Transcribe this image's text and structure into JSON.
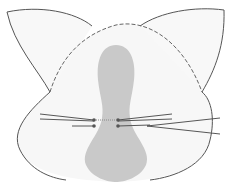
{
  "diagram": {
    "title": "",
    "width": 232,
    "height": 188,
    "colors": {
      "background": "#ffffff",
      "face_fill": "#f7f7f7",
      "outline": "#555555",
      "dashed": "#666666",
      "muzzle_fill": "#c9c9c9",
      "whisker": "#444444",
      "whisker_dot": "#555555"
    },
    "parts": {
      "left_ear": "M 50 92 C 38 70, 14 45, 7 12 C 40 5, 75 12, 92 26",
      "right_ear": "M 140 26 C 160 12, 195 6, 224 10 C 225 45, 215 70, 202 92",
      "face_outline": "M 50 92 C 30 110, 10 130, 20 150 C 30 170, 50 178, 66 180 M 150 180 C 175 177, 205 165, 210 140 C 215 120, 212 100, 202 92",
      "head_dashed": "M 50 92 C 60 60, 80 35, 116 25 C 150 18, 185 45, 202 92",
      "muzzle": "M 116 45 C 102 45, 96 60, 98 80 C 100 98, 104 105, 102 118 C 100 135, 80 150, 86 165 C 92 178, 108 182, 116 182 C 124 182, 140 178, 146 165 C 152 150, 132 135, 130 118 C 128 105, 132 98, 134 80 C 136 60, 130 45, 116 45 Z"
    },
    "whiskers": [
      {
        "x1": 40,
        "y1": 114,
        "x2": 94,
        "y2": 120
      },
      {
        "x1": 40,
        "y1": 119,
        "x2": 94,
        "y2": 121
      },
      {
        "x1": 72,
        "y1": 126,
        "x2": 94,
        "y2": 126
      },
      {
        "x1": 118,
        "y1": 120,
        "x2": 172,
        "y2": 114
      },
      {
        "x1": 118,
        "y1": 121,
        "x2": 172,
        "y2": 119
      },
      {
        "x1": 118,
        "y1": 126,
        "x2": 150,
        "y2": 125
      },
      {
        "x1": 147,
        "y1": 126,
        "x2": 220,
        "y2": 118
      },
      {
        "x1": 147,
        "y1": 126,
        "x2": 220,
        "y2": 134
      }
    ],
    "whisker_dots": [
      {
        "cx": 94,
        "cy": 120
      },
      {
        "cx": 94,
        "cy": 126
      },
      {
        "cx": 118,
        "cy": 120
      },
      {
        "cx": 118,
        "cy": 126
      }
    ],
    "dotted_bridge": {
      "x1": 96,
      "y1": 120,
      "x2": 116,
      "y2": 120
    }
  }
}
